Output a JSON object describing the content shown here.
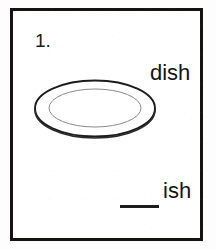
{
  "worksheet": {
    "item_number": "1.",
    "word_label": "dish",
    "answer": {
      "blank": "____",
      "suffix": "ish"
    },
    "illustration": {
      "name": "dish-plate",
      "description": "oval dinner plate drawn in perspective with an inner rim ellipse"
    },
    "colors": {
      "frame_border": "#15130f",
      "text": "#141414",
      "blank_line": "#1c1c1c",
      "outer_plate_stroke": "#1b1b1b",
      "inner_rim_stroke": "#8a8a8a",
      "page_background": "#ffffff"
    }
  }
}
